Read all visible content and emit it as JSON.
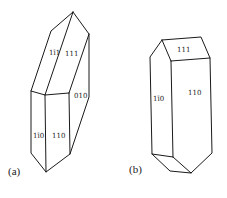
{
  "figure": {
    "panels": [
      {
        "id": "a",
        "label": "(a)",
        "faces": [
          {
            "index": "1̅1̅1",
            "display": "1ī1",
            "text": "1",
            "bar": "1",
            "rest": "1"
          },
          {
            "index": "111",
            "display": "111"
          },
          {
            "index": "010",
            "display": "010"
          },
          {
            "index": "1ħ1̅0",
            "display": "1ī0"
          },
          {
            "index": "110",
            "display": "110"
          }
        ]
      },
      {
        "id": "b",
        "label": "(b)",
        "faces": [
          {
            "index": "111",
            "display": "111"
          },
          {
            "index": "1̅1̅0",
            "display": "1ī0"
          },
          {
            "index": "110",
            "display": "110"
          }
        ]
      }
    ]
  },
  "labels": {
    "a_panel": "(a)",
    "b_panel": "(b)",
    "a_face_1bar11": "1ī1",
    "a_face_111": "111",
    "a_face_010": "010",
    "a_face_1bar10": "1ī0",
    "a_face_110": "110",
    "b_face_111": "111",
    "b_face_1bar10": "1ī0",
    "b_face_110": "110"
  }
}
